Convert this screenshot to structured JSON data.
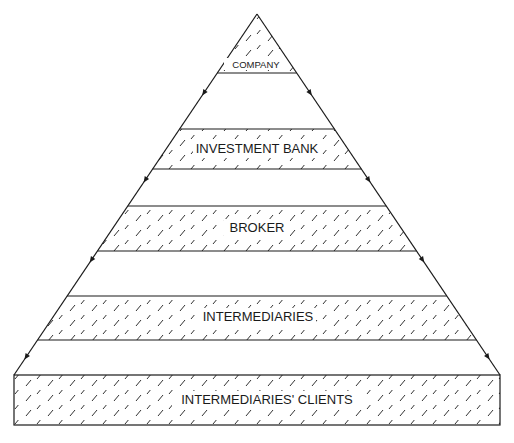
{
  "diagram": {
    "title": "",
    "type": "pyramid",
    "flow_direction": "downward",
    "colors": {
      "line": "#1a1a1a",
      "background": "#ffffff"
    },
    "levels": [
      {
        "id": "company",
        "label": "COMPANY",
        "hatched": true
      },
      {
        "id": "investment-bank",
        "label": "INVESTMENT BANK",
        "hatched": true
      },
      {
        "id": "broker",
        "label": "BROKER",
        "hatched": true
      },
      {
        "id": "intermediaries",
        "label": "INTERMEDIARIES",
        "hatched": true
      },
      {
        "id": "intermediaries-clients",
        "label": "INTERMEDIARIES' CLIENTS",
        "hatched": true
      }
    ]
  }
}
